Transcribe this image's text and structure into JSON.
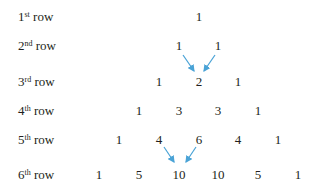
{
  "rows": [
    {
      "ordinal": "1",
      "suffix": "st",
      "word": "row",
      "top": 10,
      "values": [
        {
          "v": "1",
          "x": 199
        }
      ]
    },
    {
      "ordinal": "2",
      "suffix": "nd",
      "word": "row",
      "top": 39,
      "values": [
        {
          "v": "1",
          "x": 179
        },
        {
          "v": "1",
          "x": 218
        }
      ]
    },
    {
      "ordinal": "3",
      "suffix": "rd",
      "word": "row",
      "top": 75,
      "values": [
        {
          "v": "1",
          "x": 159
        },
        {
          "v": "2",
          "x": 199
        },
        {
          "v": "1",
          "x": 238
        }
      ]
    },
    {
      "ordinal": "4",
      "suffix": "th",
      "word": "row",
      "top": 104,
      "values": [
        {
          "v": "1",
          "x": 139
        },
        {
          "v": "3",
          "x": 179
        },
        {
          "v": "3",
          "x": 218
        },
        {
          "v": "1",
          "x": 258
        }
      ]
    },
    {
      "ordinal": "5",
      "suffix": "th",
      "word": "row",
      "top": 133,
      "values": [
        {
          "v": "1",
          "x": 119
        },
        {
          "v": "4",
          "x": 159
        },
        {
          "v": "6",
          "x": 199
        },
        {
          "v": "4",
          "x": 238
        },
        {
          "v": "1",
          "x": 278
        }
      ]
    },
    {
      "ordinal": "6",
      "suffix": "th",
      "word": "row",
      "top": 168,
      "values": [
        {
          "v": "1",
          "x": 99
        },
        {
          "v": "5",
          "x": 139
        },
        {
          "v": "10",
          "x": 179
        },
        {
          "v": "10",
          "x": 218
        },
        {
          "v": "5",
          "x": 258
        },
        {
          "v": "1",
          "x": 298
        }
      ]
    }
  ],
  "arrows": [
    {
      "x1": 183,
      "y1": 55,
      "x2": 194,
      "y2": 71
    },
    {
      "x1": 215,
      "y1": 55,
      "x2": 204,
      "y2": 71
    },
    {
      "x1": 164,
      "y1": 147,
      "x2": 174,
      "y2": 162
    },
    {
      "x1": 196,
      "y1": 147,
      "x2": 186,
      "y2": 162
    }
  ],
  "colors": {
    "arrow": "#4aa3d6",
    "text": "#231f20"
  }
}
